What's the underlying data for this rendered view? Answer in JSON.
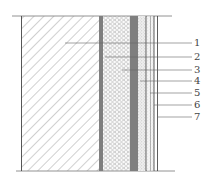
{
  "diagram": {
    "type": "wall-section-layers",
    "layers": [
      {
        "id": "wall",
        "pattern": "diagonal-hatch",
        "x0": 21,
        "x1": 99
      },
      {
        "id": "adhesive",
        "pattern": "dark-dots",
        "x0": 99,
        "x1": 103
      },
      {
        "id": "insulation",
        "pattern": "hexagon",
        "x0": 103,
        "x1": 130
      },
      {
        "id": "mesh-render",
        "pattern": "dark-dots",
        "x0": 130,
        "x1": 138
      },
      {
        "id": "plaster",
        "pattern": "light-speckle",
        "x0": 138,
        "x1": 146
      },
      {
        "id": "layer-6",
        "pattern": "thin-lines",
        "x0": 146,
        "x1": 154
      },
      {
        "id": "finish",
        "pattern": "thin-lines",
        "x0": 154,
        "x1": 158
      }
    ],
    "callouts": [
      {
        "label": "1",
        "y": 43,
        "from_x": 65
      },
      {
        "label": "2",
        "y": 57,
        "from_x": 105
      },
      {
        "label": "3",
        "y": 70,
        "from_x": 122
      },
      {
        "label": "4",
        "y": 81,
        "from_x": 140
      },
      {
        "label": "5",
        "y": 93,
        "from_x": 150
      },
      {
        "label": "6",
        "y": 105,
        "from_x": 154
      },
      {
        "label": "7",
        "y": 117,
        "from_x": 157
      }
    ]
  },
  "labels": [
    "1",
    "2",
    "3",
    "4",
    "5",
    "6",
    "7"
  ]
}
